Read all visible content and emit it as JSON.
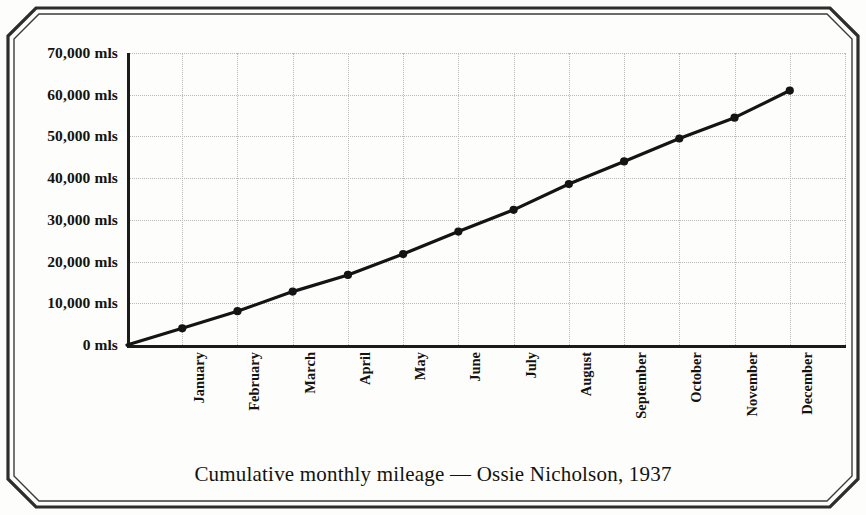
{
  "caption": "Cumulative monthly mileage — Ossie Nicholson, 1937",
  "axis": {
    "y_tick_labels": [
      "0 mls",
      "10,000 mls",
      "20,000 mls",
      "30,000 mls",
      "40,000 mls",
      "50,000 mls",
      "60,000 mls",
      "70,000 mls"
    ],
    "x_tick_labels": [
      "January",
      "February",
      "March",
      "April",
      "May",
      "June",
      "July",
      "August",
      "September",
      "October",
      "November",
      "December"
    ]
  },
  "style": {
    "line_color": "#141414",
    "marker_color": "#141414",
    "grid_color": "#b9b9b9",
    "axis_color": "#1b1b1b",
    "text_color": "#15130f",
    "paper_color": "#fdfdfc",
    "border_color": "#2a2a2a"
  },
  "chart_data": {
    "type": "line",
    "title": "Cumulative monthly mileage — Ossie Nicholson, 1937",
    "xlabel": "",
    "ylabel": "",
    "categories": [
      "January",
      "February",
      "March",
      "April",
      "May",
      "June",
      "July",
      "August",
      "September",
      "October",
      "November",
      "December"
    ],
    "values": [
      4000,
      8100,
      12800,
      16800,
      21800,
      27200,
      32400,
      38600,
      44000,
      49500,
      54500,
      61000
    ],
    "ylim": [
      0,
      70000
    ],
    "ytick_values": [
      0,
      10000,
      20000,
      30000,
      40000,
      50000,
      60000,
      70000
    ],
    "ytick_labels": [
      "0 mls",
      "10,000 mls",
      "20,000 mls",
      "30,000 mls",
      "40,000 mls",
      "50,000 mls",
      "60,000 mls",
      "70,000 mls"
    ],
    "grid": true,
    "legend": false,
    "markers": "filled-circle",
    "unit": "mls"
  }
}
